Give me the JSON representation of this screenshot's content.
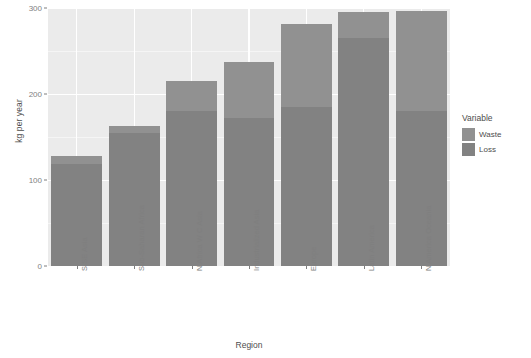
{
  "chart_data": {
    "type": "bar",
    "subtype": "stacked",
    "title": "",
    "xlabel": "Region",
    "ylabel": "kg per year",
    "categories": [
      "S SE Asia",
      "Sub-Saharan Africa",
      "N Africa W C Asia",
      "Industrialized Asia",
      "Europe",
      "Latin America",
      "N America Oceania"
    ],
    "series": [
      {
        "name": "Loss",
        "color": "#828282",
        "values": [
          119,
          155,
          180,
          172,
          185,
          265,
          180
        ]
      },
      {
        "name": "Waste",
        "color": "#919191",
        "values": [
          9,
          8,
          35,
          65,
          97,
          30,
          117
        ]
      }
    ],
    "totals": [
      128,
      163,
      215,
      237,
      282,
      295,
      297
    ],
    "ylim": [
      0,
      300
    ],
    "ytick_values": [
      0,
      100,
      200,
      300
    ],
    "ytick_labels": [
      "0",
      "100",
      "200",
      "300"
    ],
    "yminor_values": [
      50,
      150,
      250
    ],
    "grid": true,
    "legend_position": "right",
    "legend_title": "Variable",
    "legend_entries": [
      "Waste",
      "Loss"
    ],
    "panel_background": "#ebebeb",
    "grid_color": "#ffffff"
  }
}
